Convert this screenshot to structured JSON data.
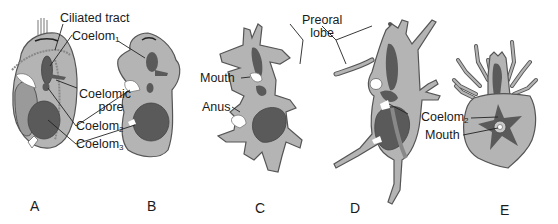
{
  "figure": {
    "panels": [
      {
        "id": "A",
        "letter": "A"
      },
      {
        "id": "B",
        "letter": "B"
      },
      {
        "id": "C",
        "letter": "C"
      },
      {
        "id": "D",
        "letter": "D"
      },
      {
        "id": "E",
        "letter": "E"
      }
    ],
    "labels": {
      "ciliated_tract": "Ciliated tract",
      "coelom1_base": "Coelom",
      "coelom1_sub": "1",
      "coelomic_pore_line1": "Coelomic",
      "coelomic_pore_line2": "pore",
      "coelom2_base": "Coelom",
      "coelom2_sub": "2",
      "coelom3_base": "Coelom",
      "coelom3_sub": "3",
      "mouth_c": "Mouth",
      "anus_c": "Anus",
      "preoral_line1": "Preoral",
      "preoral_line2": "lobe",
      "coelom2_e_base": "Coelom",
      "coelom2_e_sub": "2",
      "mouth_e": "Mouth"
    },
    "colors": {
      "body_fill": "#b4b4b4",
      "body_stroke": "#555555",
      "coelom_dark": "#5a5a5a",
      "coelom_mid": "#7a7a7a",
      "leader_line": "#222222"
    }
  }
}
